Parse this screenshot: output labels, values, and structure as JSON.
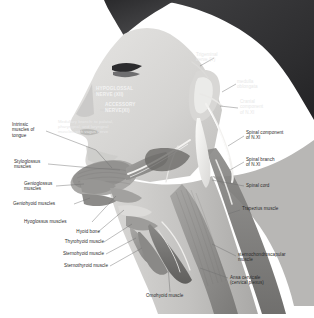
{
  "figure": {
    "view": "lateral",
    "style": "grayscale anatomical illustration",
    "colors": {
      "background": "#ffffff",
      "skin_light": "#dedddb",
      "skin_mid": "#c6c5c3",
      "hair_dark": "#3b3b3d",
      "hair_darkest": "#232325",
      "muscle_mid": "#9b9a98",
      "muscle_dark": "#6f6e6c",
      "nerve_light": "#f0efed",
      "label_text": "#2b2b2b",
      "label_text_on_dark": "#e8e8e8",
      "leader_line": "#6e6e6e"
    }
  },
  "labels": {
    "hypoglossal_nerve": "HYPOGLOSSAL\nNERVE (XII)",
    "accessory_nerve": "ACCESSORY\nNERVE(XI)",
    "medullary_branch": "Medullary branch: to palatal,\npharyngeal, and laryngeal\nmuscles with vagus nerve",
    "trigeminal_nerve": "Trigeminal\nnerve (V)",
    "medulla_oblongata": "medulla\noblongata",
    "cranial_component": "Cranial\ncomponent\nof N.XI",
    "spinal_component": "Spinal component\nof N.XI",
    "spinal_branch": "Spinal branch\nof N.XI",
    "spinal_cord": "Spinal cord",
    "trapezius_muscle": "Trapezius muscle",
    "sternochondroscapular_muscle": "sternochondroscapular\nmuscle",
    "ansa_cervicale": "Ansa cervicale\n(cervical plexus)",
    "omohyoid_muscle": "Omohyoid muscle",
    "sternothyroid_muscle": "Sternothyroid muscle",
    "sternohyoid_muscle": "Sternohyoid muscle",
    "thyrohyoid_muscle": "Thyrohyoid muscle",
    "hyoid_bone": "Hyoid bone",
    "hyoglossus_muscles": "Hyoglossus muscles",
    "geniohyoid_muscles": "Geniohyoid muscles",
    "genioglossus_muscles": "Genioglossus\nmuscles",
    "styloglossus_muscles": "Styloglossus\nmuscles",
    "intrinsic_muscles_of_tongue": "Intrinsic\nmuscles of\ntongue"
  }
}
